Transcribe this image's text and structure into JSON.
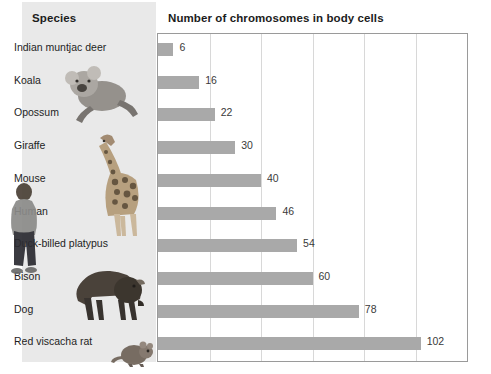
{
  "header": {
    "species_label": "Species",
    "chart_title": "Number of chromosomes in body cells"
  },
  "colors": {
    "bar": "#a9a9a9",
    "panel": "#e9e9e9",
    "grid": "#d8d8d8",
    "frame": "#9a9a9a",
    "text": "#1e1e1e"
  },
  "artwork": [
    {
      "name": "human-figure-image"
    },
    {
      "name": "koala-image"
    },
    {
      "name": "giraffe-image"
    },
    {
      "name": "bison-image"
    },
    {
      "name": "red-viscacha-rat-image"
    }
  ],
  "chart_data": {
    "type": "bar",
    "orientation": "horizontal",
    "title": "Number of chromosomes in body cells",
    "xlabel": "",
    "ylabel": "Species",
    "xlim": [
      0,
      120
    ],
    "grid": true,
    "gridline_interval": 20,
    "tick_labels_shown": false,
    "legend": null,
    "value_labels": true,
    "categories": [
      "Indian muntjac deer",
      "Koala",
      "Opossum",
      "Giraffe",
      "Mouse",
      "Human",
      "Duck-billed platypus",
      "Bison",
      "Dog",
      "Red viscacha rat"
    ],
    "values": [
      6,
      16,
      22,
      30,
      40,
      46,
      54,
      60,
      78,
      102
    ]
  }
}
